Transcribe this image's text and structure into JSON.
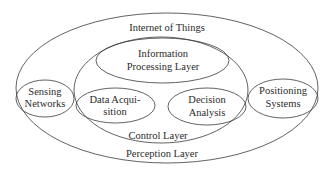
{
  "diagram": {
    "outer": {
      "label": "Internet of Things",
      "cx": 167,
      "cy": 88,
      "rx": 151,
      "ry": 75
    },
    "control_layer": {
      "label": "Control Layer",
      "cx": 161,
      "cy": 90,
      "rx": 87,
      "ry": 53
    },
    "information_processing": {
      "line1": "Information",
      "line2": "Processing Layer",
      "cx": 162.5,
      "cy": 60.5,
      "rx": 66.5,
      "ry": 22.5
    },
    "sensing_networks": {
      "line1": "Sensing",
      "line2": "Networks",
      "cx": 45,
      "cy": 98.5,
      "rx": 29,
      "ry": 18.5
    },
    "positioning_systems": {
      "line1": "Positioning",
      "line2": "Systems",
      "cx": 283,
      "cy": 98.5,
      "rx": 35,
      "ry": 19.5
    },
    "data_acquisition": {
      "line1": "Data Acqui-",
      "line2": "sition",
      "cx": 115.5,
      "cy": 105.5,
      "rx": 39.5,
      "ry": 17.5
    },
    "decision_analysis": {
      "line1": "Decision",
      "line2": "Analysis",
      "cx": 207,
      "cy": 106.5,
      "rx": 39,
      "ry": 18.5
    },
    "perception_layer": {
      "label": "Perception Layer"
    }
  }
}
